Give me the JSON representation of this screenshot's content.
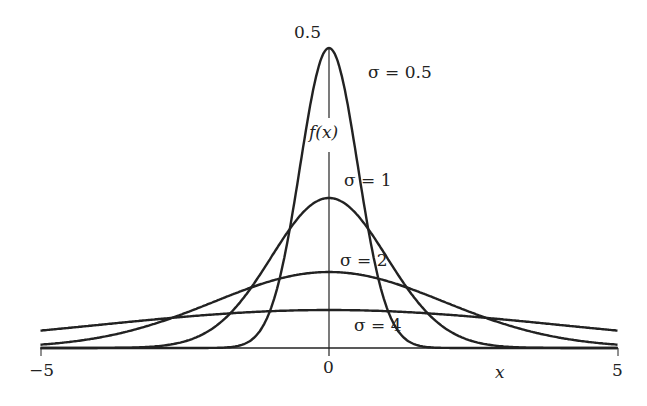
{
  "chart_data": {
    "type": "line",
    "title": "",
    "xlabel": "x",
    "ylabel": "f(x)",
    "xlim": [
      -5,
      5
    ],
    "y_tick_label": "0.5",
    "x_tick_labels": [
      "−5",
      "0",
      "5"
    ],
    "grid": false,
    "series": [
      {
        "name": "σ = 0.5",
        "sigma": 0.5,
        "peak_pixel_y": 48
      },
      {
        "name": "σ = 1",
        "sigma": 1,
        "peak_pixel_y": 198
      },
      {
        "name": "σ = 2",
        "sigma": 2,
        "peak_pixel_y": 272
      },
      {
        "name": "σ = 4",
        "sigma": 4,
        "peak_pixel_y": 310
      }
    ],
    "annotations": [
      "σ = 0.5",
      "σ = 1",
      "σ = 2",
      "σ = 4"
    ]
  },
  "labels": {
    "ytick": "0.5",
    "ylabel": "f(x)",
    "xlabel": "x",
    "xmin": "−5",
    "xzero": "0",
    "xmax": "5",
    "s05": "σ = 0.5",
    "s1": "σ = 1",
    "s2": "σ = 2",
    "s4": "σ = 4"
  }
}
